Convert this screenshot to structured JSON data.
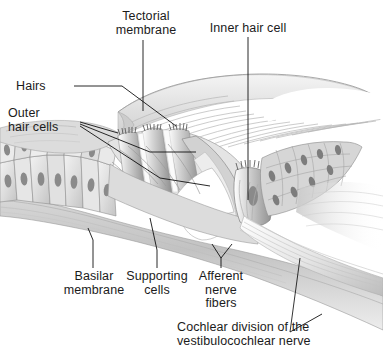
{
  "figure": {
    "style": "grayscale-pencil-anatomical-illustration",
    "background_color": "#ffffff",
    "text_color": "#1b1b1b",
    "leader_line_color": "#111111",
    "width_px": 383,
    "height_px": 356
  },
  "labels": {
    "tectorial_membrane": "Tectorial\nmembrane",
    "inner_hair_cell": "Inner hair cell",
    "hairs": "Hairs",
    "outer_hair_cells": "Outer\nhair cells",
    "basilar_membrane": "Basilar\nmembrane",
    "supporting_cells": "Supporting\ncells",
    "afferent_nerve_fibers": "Afferent\nnerve\nfibers",
    "cochlear_division": "Cochlear division of the\nvestibulocochlear nerve"
  }
}
